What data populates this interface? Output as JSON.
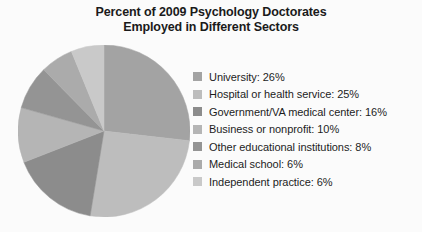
{
  "chart_data": {
    "type": "pie",
    "title": "Percent of 2009 Psychology Doctorates Employed in Different Sectors",
    "title_lines": [
      "Percent of 2009 Psychology Doctorates",
      "Employed in Different Sectors"
    ],
    "categories": [
      "University",
      "Hospital or health service",
      "Government/VA medical center",
      "Business or nonprofit",
      "Other educational institutions",
      "Medical school",
      "Independent practice"
    ],
    "values": [
      26,
      25,
      16,
      10,
      8,
      6,
      6
    ],
    "value_suffix": "%",
    "colors": [
      "#a3a3a3",
      "#bdbdbd",
      "#8c8c8c",
      "#b5b5b5",
      "#949494",
      "#ababab",
      "#c9c9c9"
    ],
    "start_angle_deg": 0,
    "direction": "clockwise",
    "legend_position": "right",
    "grid": false,
    "xlabel": "",
    "ylabel": "",
    "legend": [
      {
        "label": "University: 26%",
        "color": "#a3a3a3"
      },
      {
        "label": "Hospital or health service: 25%",
        "color": "#bdbdbd"
      },
      {
        "label": "Government/VA medical center: 16%",
        "color": "#8c8c8c"
      },
      {
        "label": "Business or nonprofit: 10%",
        "color": "#b5b5b5"
      },
      {
        "label": "Other educational institutions: 8%",
        "color": "#949494"
      },
      {
        "label": "Medical school: 6%",
        "color": "#ababab"
      },
      {
        "label": "Independent practice: 6%",
        "color": "#c9c9c9"
      }
    ]
  }
}
